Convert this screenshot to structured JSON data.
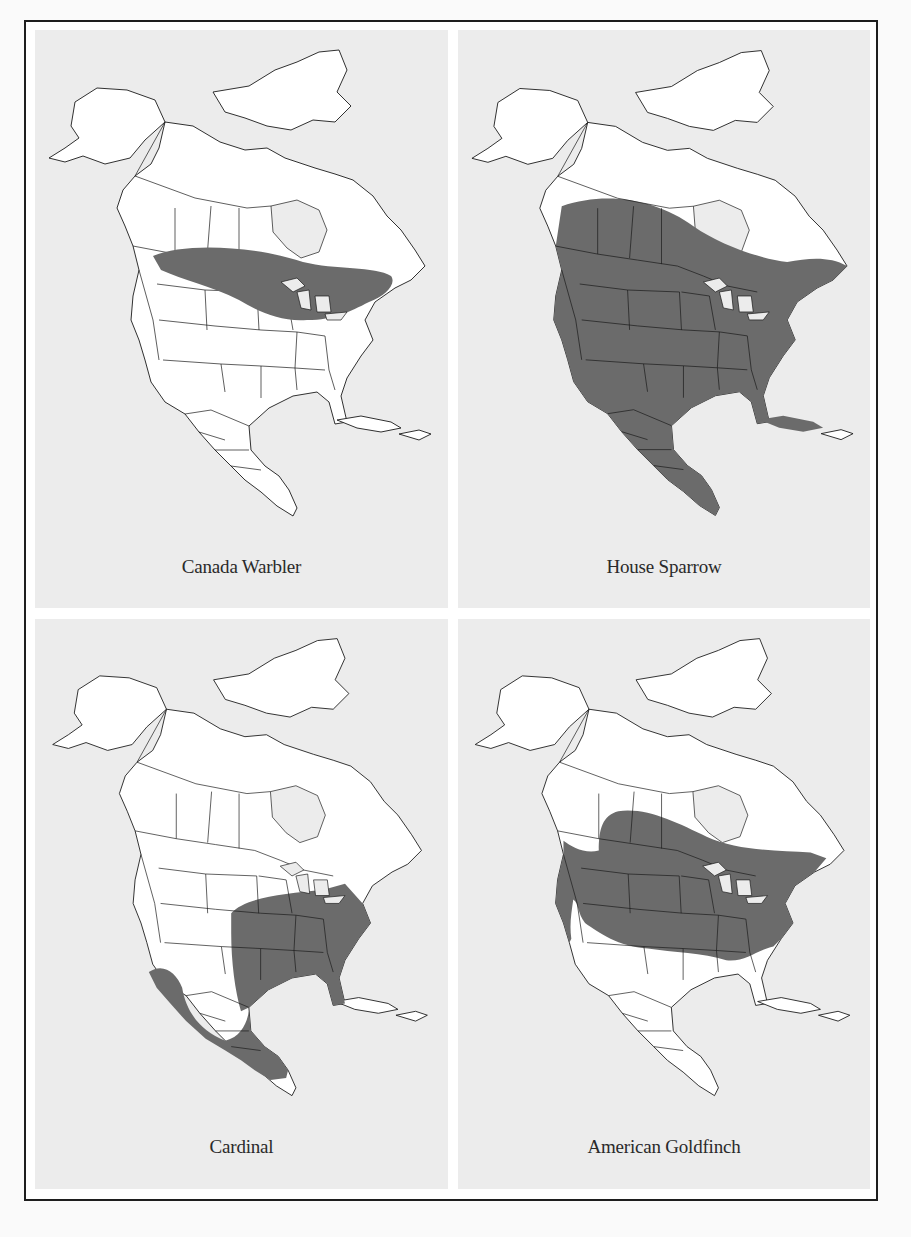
{
  "figure": {
    "range_color": "#6b6b6b",
    "panel_bg": "#ececec",
    "land_color": "#ffffff",
    "panels": [
      {
        "label": "Canada Warbler",
        "range_description": "Band across southern Canada from Alberta to the Maritimes, south to the Great Lakes and northern New England"
      },
      {
        "label": "House Sparrow",
        "range_description": "Most of southern Canada, the entire United States, Mexico, Central America and Cuba"
      },
      {
        "label": "Cardinal",
        "range_description": "Eastern United States west to the Great Plains, southern Texas, Mexico and northern Central America"
      },
      {
        "label": "American Goldfinch",
        "range_description": "Southern Canada and the northern two-thirds of the United States, Pacific coast to Atlantic coast"
      }
    ]
  }
}
